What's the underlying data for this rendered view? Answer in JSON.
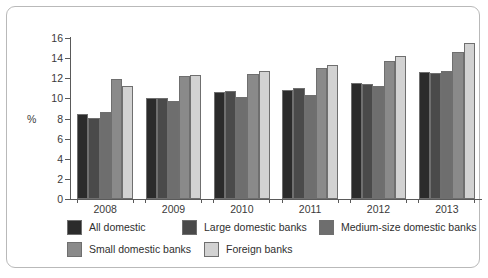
{
  "chart_data": {
    "type": "bar",
    "title": "",
    "subtitle": "",
    "xlabel": "",
    "ylabel": "%",
    "ylim": [
      0,
      16
    ],
    "ytick_step": 2,
    "yticks": [
      "16",
      "14",
      "12",
      "10",
      "8",
      "6",
      "4",
      "2",
      "0"
    ],
    "grid": false,
    "legend_position": "bottom",
    "categories": [
      "2008",
      "2009",
      "2010",
      "2011",
      "2012",
      "2013"
    ],
    "series": [
      {
        "name": "All domestic",
        "color": "#2b2b2b",
        "values": [
          8.4,
          10.0,
          10.6,
          10.8,
          11.5,
          12.6
        ]
      },
      {
        "name": "Large domestic banks",
        "color": "#4a4a4a",
        "values": [
          8.1,
          10.0,
          10.7,
          11.0,
          11.4,
          12.5
        ]
      },
      {
        "name": "Medium-size domestic banks",
        "color": "#6e6e6e",
        "values": [
          8.6,
          9.7,
          10.1,
          10.3,
          11.2,
          12.7
        ]
      },
      {
        "name": "Small domestic banks",
        "color": "#8a8a8a",
        "values": [
          11.9,
          12.2,
          12.4,
          13.0,
          13.7,
          14.6
        ]
      },
      {
        "name": "Foreign banks",
        "color": "#d2d2d2",
        "values": [
          11.2,
          12.3,
          12.7,
          13.3,
          14.2,
          15.5
        ]
      }
    ]
  },
  "axis": {
    "y_title": "%"
  },
  "legend": {
    "rows": [
      [
        {
          "label": "All domestic",
          "color": "#2b2b2b",
          "left": 0
        },
        {
          "label": "Large domestic banks",
          "color": "#4a4a4a",
          "left": 115
        },
        {
          "label": "Medium-size domestic banks",
          "color": "#6e6e6e",
          "left": 252
        }
      ],
      [
        {
          "label": "Small domestic banks",
          "color": "#8a8a8a",
          "left": 0
        },
        {
          "label": "Foreign banks",
          "color": "#d2d2d2",
          "left": 137
        }
      ]
    ]
  }
}
